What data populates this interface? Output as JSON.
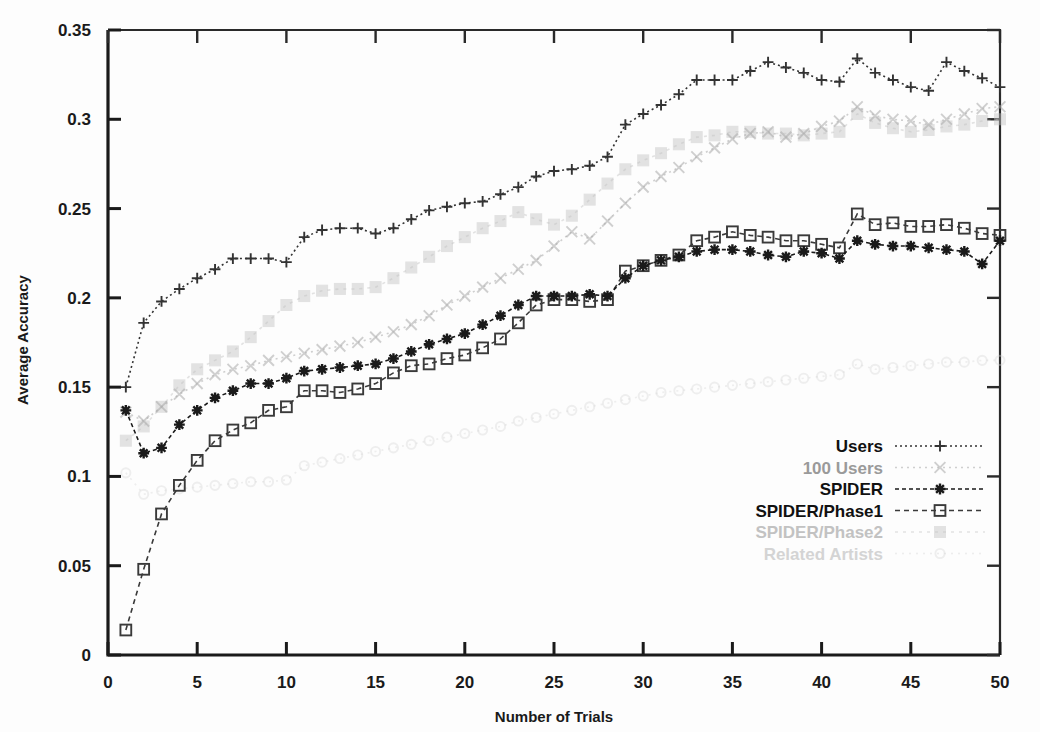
{
  "chart_data": {
    "type": "line",
    "title": "",
    "xlabel": "Number of Trials",
    "ylabel": "Average Accuracy",
    "xlim": [
      0,
      50
    ],
    "ylim": [
      0,
      0.35
    ],
    "xticks": [
      "0",
      "5",
      "10",
      "15",
      "20",
      "25",
      "30",
      "35",
      "40",
      "45",
      "50"
    ],
    "xtick_values": [
      0,
      5,
      10,
      15,
      20,
      25,
      30,
      35,
      40,
      45,
      50
    ],
    "yticks": [
      "0",
      "0.05",
      "0.1",
      "0.15",
      "0.2",
      "0.25",
      "0.3",
      "0.35"
    ],
    "ytick_values": [
      0,
      0.05,
      0.1,
      0.15,
      0.2,
      0.25,
      0.3,
      0.35
    ],
    "grid": false,
    "legend_position": "center-right",
    "x": [
      1,
      2,
      3,
      4,
      5,
      6,
      7,
      8,
      9,
      10,
      11,
      12,
      13,
      14,
      15,
      16,
      17,
      18,
      19,
      20,
      21,
      22,
      23,
      24,
      25,
      26,
      27,
      28,
      29,
      30,
      31,
      32,
      33,
      34,
      35,
      36,
      37,
      38,
      39,
      40,
      41,
      42,
      43,
      44,
      45,
      46,
      47,
      48,
      49,
      50
    ],
    "series": [
      {
        "name": "Users",
        "marker": "plus",
        "color": "#333333",
        "opacity": 1.0,
        "dash": "2,3",
        "values": [
          0.15,
          0.186,
          0.198,
          0.205,
          0.211,
          0.216,
          0.222,
          0.222,
          0.222,
          0.22,
          0.234,
          0.238,
          0.239,
          0.239,
          0.236,
          0.239,
          0.244,
          0.249,
          0.251,
          0.253,
          0.254,
          0.258,
          0.262,
          0.268,
          0.271,
          0.272,
          0.274,
          0.279,
          0.297,
          0.303,
          0.308,
          0.314,
          0.322,
          0.322,
          0.322,
          0.327,
          0.332,
          0.329,
          0.326,
          0.322,
          0.321,
          0.334,
          0.326,
          0.322,
          0.318,
          0.316,
          0.332,
          0.327,
          0.323,
          0.318
        ]
      },
      {
        "name": "100 Users",
        "marker": "cross",
        "color": "#aaaaaa",
        "opacity": 0.55,
        "dash": "2,4",
        "values": [
          0.136,
          0.131,
          0.139,
          0.146,
          0.152,
          0.157,
          0.16,
          0.162,
          0.165,
          0.167,
          0.169,
          0.171,
          0.173,
          0.175,
          0.178,
          0.181,
          0.185,
          0.19,
          0.196,
          0.201,
          0.206,
          0.211,
          0.216,
          0.221,
          0.229,
          0.237,
          0.233,
          0.243,
          0.253,
          0.262,
          0.268,
          0.273,
          0.279,
          0.284,
          0.289,
          0.292,
          0.293,
          0.29,
          0.292,
          0.296,
          0.299,
          0.307,
          0.302,
          0.3,
          0.299,
          0.297,
          0.3,
          0.303,
          0.306,
          0.307
        ]
      },
      {
        "name": "SPIDER",
        "marker": "asterisk",
        "color": "#1a1a1a",
        "opacity": 1.0,
        "dash": "4,3",
        "values": [
          0.137,
          0.113,
          0.116,
          0.129,
          0.137,
          0.144,
          0.148,
          0.152,
          0.152,
          0.155,
          0.159,
          0.16,
          0.161,
          0.162,
          0.163,
          0.166,
          0.17,
          0.174,
          0.177,
          0.18,
          0.185,
          0.19,
          0.196,
          0.201,
          0.201,
          0.201,
          0.202,
          0.201,
          0.211,
          0.218,
          0.221,
          0.223,
          0.226,
          0.227,
          0.227,
          0.226,
          0.224,
          0.223,
          0.226,
          0.225,
          0.222,
          0.232,
          0.23,
          0.229,
          0.229,
          0.228,
          0.227,
          0.226,
          0.219,
          0.232
        ]
      },
      {
        "name": "SPIDER/Phase1",
        "marker": "square",
        "color": "#3a3a3a",
        "opacity": 1.0,
        "dash": "5,4",
        "values": [
          0.014,
          0.048,
          0.079,
          0.095,
          0.109,
          0.12,
          0.126,
          0.13,
          0.137,
          0.139,
          0.148,
          0.148,
          0.147,
          0.149,
          0.152,
          0.158,
          0.162,
          0.163,
          0.166,
          0.168,
          0.172,
          0.177,
          0.186,
          0.196,
          0.199,
          0.199,
          0.198,
          0.199,
          0.215,
          0.218,
          0.221,
          0.224,
          0.232,
          0.234,
          0.237,
          0.235,
          0.234,
          0.232,
          0.232,
          0.23,
          0.228,
          0.247,
          0.241,
          0.242,
          0.24,
          0.24,
          0.241,
          0.239,
          0.236,
          0.235
        ]
      },
      {
        "name": "SPIDER/Phase2",
        "marker": "shaded-square",
        "color": "#c2c2c2",
        "opacity": 0.45,
        "dash": "3,5",
        "values": [
          0.12,
          0.128,
          0.139,
          0.151,
          0.16,
          0.165,
          0.17,
          0.178,
          0.187,
          0.196,
          0.201,
          0.204,
          0.205,
          0.205,
          0.206,
          0.211,
          0.217,
          0.223,
          0.229,
          0.234,
          0.239,
          0.243,
          0.248,
          0.244,
          0.241,
          0.246,
          0.255,
          0.264,
          0.272,
          0.277,
          0.281,
          0.286,
          0.29,
          0.291,
          0.293,
          0.293,
          0.292,
          0.292,
          0.291,
          0.292,
          0.293,
          0.303,
          0.298,
          0.295,
          0.293,
          0.294,
          0.296,
          0.297,
          0.299,
          0.3
        ]
      },
      {
        "name": "Related Artists",
        "marker": "circle",
        "color": "#d4d4d4",
        "opacity": 0.38,
        "dash": "2,5",
        "values": [
          0.102,
          0.09,
          0.092,
          0.093,
          0.094,
          0.095,
          0.096,
          0.097,
          0.097,
          0.098,
          0.106,
          0.108,
          0.11,
          0.112,
          0.114,
          0.116,
          0.118,
          0.12,
          0.122,
          0.124,
          0.126,
          0.128,
          0.131,
          0.133,
          0.135,
          0.137,
          0.139,
          0.141,
          0.143,
          0.145,
          0.147,
          0.148,
          0.149,
          0.15,
          0.151,
          0.152,
          0.153,
          0.154,
          0.155,
          0.156,
          0.157,
          0.163,
          0.16,
          0.161,
          0.162,
          0.163,
          0.164,
          0.164,
          0.165,
          0.165
        ]
      }
    ]
  },
  "legend": {
    "entries": [
      {
        "label": "Users"
      },
      {
        "label": "100 Users"
      },
      {
        "label": "SPIDER"
      },
      {
        "label": "SPIDER/Phase1"
      },
      {
        "label": "SPIDER/Phase2"
      },
      {
        "label": "Related Artists"
      }
    ]
  }
}
